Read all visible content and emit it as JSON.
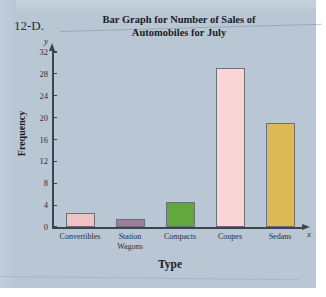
{
  "problem_number": "12-D.",
  "page": {
    "background_color": "#b9c6d4"
  },
  "axis": {
    "y_variable": "y",
    "x_variable": "x"
  },
  "chart_data": {
    "type": "bar",
    "title": "Bar Graph for Number of Sales of Automobiles for July",
    "title_line1": "Bar Graph for Number of Sales of",
    "title_line2": "Automobiles for July",
    "xlabel": "Type",
    "ylabel": "Frequency",
    "categories": [
      "Convertibles",
      "Station Wagons",
      "Compacts",
      "Coupes",
      "Sedans"
    ],
    "category_labels": [
      {
        "line1": "Convertibles",
        "line2": ""
      },
      {
        "line1": "Station",
        "line2": "Wagons"
      },
      {
        "line1": "Compacts",
        "line2": ""
      },
      {
        "line1": "Coupes",
        "line2": ""
      },
      {
        "line1": "Sedans",
        "line2": ""
      }
    ],
    "values": [
      2.5,
      1.5,
      4.5,
      29,
      19
    ],
    "colors": [
      "#efc3c6",
      "#9b7e9c",
      "#62a83c",
      "#fad4d6",
      "#ddb857"
    ],
    "ylim": [
      0,
      32
    ],
    "yticks": [
      0,
      4,
      8,
      12,
      16,
      20,
      24,
      28,
      32
    ],
    "ytick_labels": [
      "0",
      "4",
      "8",
      "12",
      "16",
      "20",
      "24",
      "28",
      "32"
    ],
    "grid": false,
    "legend": "none"
  }
}
